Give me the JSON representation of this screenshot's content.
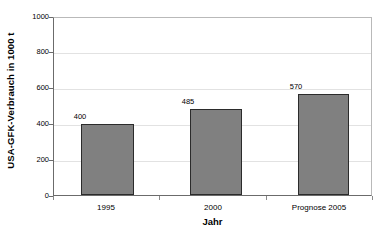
{
  "chart_data": {
    "type": "bar",
    "title": "",
    "subtitle": "",
    "xlabel": "Jahr",
    "ylabel": "USA-GFK-Verbrauch in 1000 t",
    "categories": [
      "1995",
      "2000",
      "Prognose 2005"
    ],
    "values": [
      400,
      485,
      570
    ],
    "data_labels": [
      "400",
      "485",
      "570"
    ],
    "series": [
      {
        "name": "USA-GFK-Verbrauch",
        "values": [
          400,
          485,
          570
        ],
        "color": "#808080"
      }
    ],
    "ylim": [
      0,
      1000
    ],
    "ytick_values": [
      0,
      200,
      400,
      600,
      800,
      1000
    ],
    "ytick_labels": [
      "0",
      "200",
      "400",
      "600",
      "800",
      "1000"
    ],
    "grid": true,
    "grid_axis": "y",
    "legend": false,
    "legend_position": "none",
    "bar_fill_color": "#808080",
    "bar_border_color": "#2b2b2b",
    "plot_background": "#ffffff",
    "gridline_color": "#e2e2e2",
    "axis_color": "#6b6b6b"
  }
}
